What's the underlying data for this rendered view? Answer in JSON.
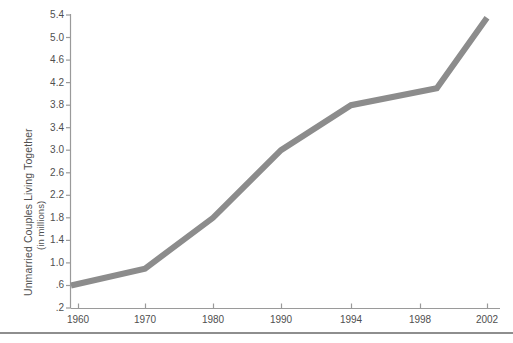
{
  "chart_data": {
    "type": "line",
    "title": "",
    "xlabel": "",
    "ylabel": "Unmarried Couples Living Together",
    "ylabel_sub": "(in millions)",
    "x": [
      1960,
      1970,
      1980,
      1990,
      1994,
      1999,
      2002
    ],
    "values": [
      0.6,
      0.9,
      1.8,
      3.0,
      3.8,
      4.1,
      5.35
    ],
    "series": [
      {
        "name": "Unmarried couples living together",
        "values": [
          0.6,
          0.9,
          1.8,
          3.0,
          3.8,
          4.1,
          5.35
        ]
      }
    ],
    "x_tick_labels": [
      "1960",
      "1970",
      "1980",
      "1990",
      "1994",
      "1998",
      "2002"
    ],
    "x_tick_values": [
      1960,
      1970,
      1980,
      1990,
      1994,
      1998,
      2002
    ],
    "x_tick_positions_px": [
      78,
      145,
      213,
      281,
      351,
      420,
      487
    ],
    "y_tick_labels": [
      ".2",
      ".6",
      "1.0",
      "1.4",
      "1.8",
      "2.2",
      "2.6",
      "3.0",
      "3.4",
      "3.8",
      "4.2",
      "4.6",
      "5.0",
      "5.4"
    ],
    "y_tick_values": [
      0.2,
      0.6,
      1.0,
      1.4,
      1.8,
      2.2,
      2.6,
      3.0,
      3.4,
      3.8,
      4.2,
      4.6,
      5.0,
      5.4
    ],
    "ylim": [
      0.2,
      5.4
    ],
    "grid": false,
    "legend": false,
    "legend_position": "none",
    "line_color": "#8c8c8c",
    "axis_color": "#9a9a9a",
    "text_color": "#4f4f4f",
    "background": "#ffffff",
    "line_width_px": 6,
    "annotations": []
  },
  "footer": {
    "rule_color": "#8e8e8e"
  }
}
